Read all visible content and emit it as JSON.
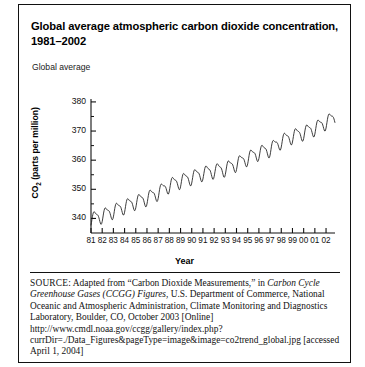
{
  "figure": {
    "title": "Global average atmospheric carbon dioxide concentration, 1981–2002",
    "axis_note": "Global average",
    "divider": "horizontal-rule",
    "frame_color": "#111111"
  },
  "source": {
    "kicker": "SOURCE:",
    "line1_a": " Adapted from “Carbon Dioxide Measurements,” in ",
    "line1_italic": "Carbon Cycle Greenhouse Gases (CCGG) Figures,",
    "line2": " U.S. Department of Commerce, National Oceanic and Atmospheric Administration, Climate Monitoring and Diagnostics Laboratory, Boulder, CO, October 2003 [Online] http://www.cmdl.noaa.gov/ccgg/gallery/index.php?currDir=./Data_Figures&pageType=image&image=co2trend_global.jpg [accessed April 1, 2004]"
  },
  "chart_data": {
    "type": "line",
    "title": "Global average atmospheric carbon dioxide concentration, 1981–2002",
    "xlabel": "Year",
    "ylabel": "CO2 (parts per million)",
    "ylabel_display": "CO₂ (parts per million)",
    "grid": false,
    "legend": "none",
    "line_color": "#1a1a1a",
    "xlim": [
      1981,
      2002.8
    ],
    "ylim": [
      335,
      381
    ],
    "ytick_values": [
      340,
      350,
      360,
      370,
      380
    ],
    "ytick_labels": [
      "340",
      "350",
      "360",
      "370",
      "380"
    ],
    "yminor_step": 5,
    "xtick_labels": [
      "81",
      "82",
      "83",
      "84",
      "85",
      "86",
      "87",
      "88",
      "89",
      "90",
      "91",
      "92",
      "93",
      "94",
      "95",
      "96",
      "97",
      "98",
      "99",
      "00",
      "01",
      "02"
    ],
    "xtick_values": [
      1981,
      1982,
      1983,
      1984,
      1985,
      1986,
      1987,
      1988,
      1989,
      1990,
      1991,
      1992,
      1993,
      1994,
      1995,
      1996,
      1997,
      1998,
      1999,
      2000,
      2001,
      2002
    ],
    "series_name": "Global average CO2",
    "annual_mean": [
      {
        "year": 1981,
        "value": 339.8
      },
      {
        "year": 1982,
        "value": 341.0
      },
      {
        "year": 1983,
        "value": 342.6
      },
      {
        "year": 1984,
        "value": 344.2
      },
      {
        "year": 1985,
        "value": 345.7
      },
      {
        "year": 1986,
        "value": 347.0
      },
      {
        "year": 1987,
        "value": 348.9
      },
      {
        "year": 1988,
        "value": 351.5
      },
      {
        "year": 1989,
        "value": 352.9
      },
      {
        "year": 1990,
        "value": 354.2
      },
      {
        "year": 1991,
        "value": 355.6
      },
      {
        "year": 1992,
        "value": 356.4
      },
      {
        "year": 1993,
        "value": 357.1
      },
      {
        "year": 1994,
        "value": 358.8
      },
      {
        "year": 1995,
        "value": 360.8
      },
      {
        "year": 1996,
        "value": 362.6
      },
      {
        "year": 1997,
        "value": 363.8
      },
      {
        "year": 1998,
        "value": 366.6
      },
      {
        "year": 1999,
        "value": 368.3
      },
      {
        "year": 2000,
        "value": 369.5
      },
      {
        "year": 2001,
        "value": 371.0
      },
      {
        "year": 2002,
        "value": 373.1
      }
    ],
    "seasonal_amplitude_ppm": 2.6
  }
}
